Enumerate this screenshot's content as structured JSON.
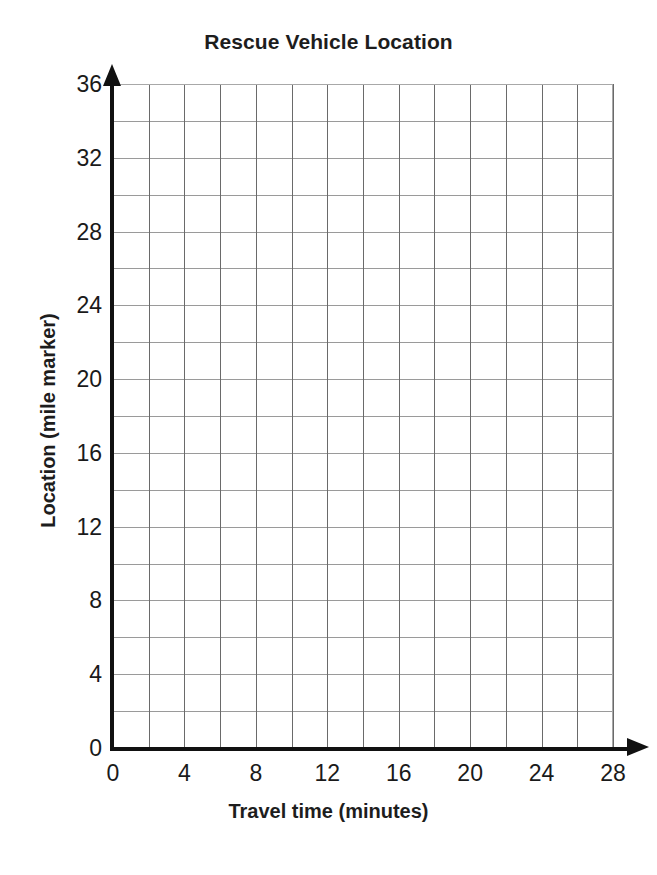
{
  "chart_data": {
    "type": "line",
    "title": "Rescue Vehicle Location",
    "xlabel": "Travel time (minutes)",
    "ylabel": "Location (mile marker)",
    "xlim": [
      0,
      28
    ],
    "ylim": [
      0,
      36
    ],
    "x_major_tick_labels": [
      "0",
      "4",
      "8",
      "12",
      "16",
      "20",
      "24",
      "28"
    ],
    "x_major_tick_values": [
      0,
      4,
      8,
      12,
      16,
      20,
      24,
      28
    ],
    "x_gridline_values": [
      0,
      2,
      4,
      6,
      8,
      10,
      12,
      14,
      16,
      18,
      20,
      22,
      24,
      26,
      28
    ],
    "x_gridline_step": 2,
    "y_major_tick_labels": [
      "0",
      "4",
      "8",
      "12",
      "16",
      "20",
      "24",
      "28",
      "32",
      "36"
    ],
    "y_major_tick_values": [
      0,
      4,
      8,
      12,
      16,
      20,
      24,
      28,
      32,
      36
    ],
    "y_gridline_values": [
      0,
      2,
      4,
      6,
      8,
      10,
      12,
      14,
      16,
      18,
      20,
      22,
      24,
      26,
      28,
      30,
      32,
      34,
      36
    ],
    "y_gridline_step": 2,
    "grid": true,
    "legend": null,
    "series": [],
    "values": [],
    "annotations": [],
    "colors": {
      "background": "#ffffff",
      "axis": "#111111",
      "gridline_vertical": "#6a6a6a",
      "gridline_horizontal": "#9a9a9a",
      "text": "#1a1a1a"
    }
  }
}
